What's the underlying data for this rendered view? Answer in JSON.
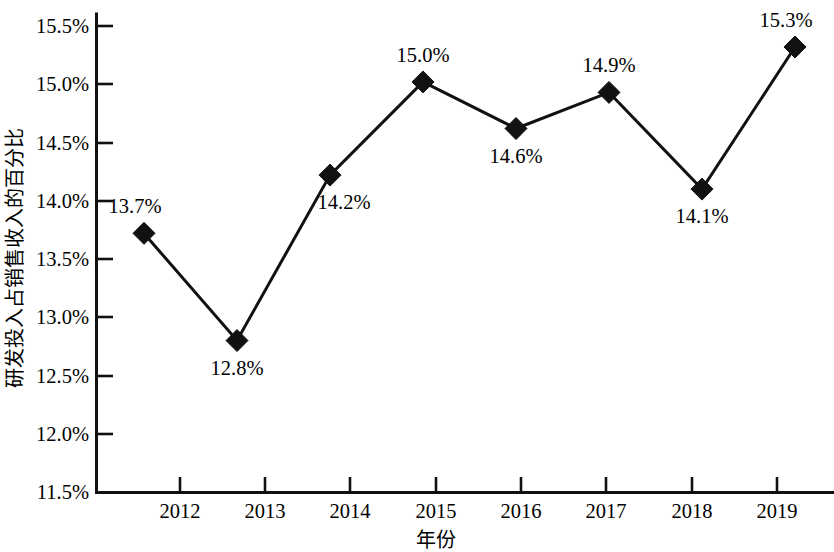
{
  "chart_data": {
    "type": "line",
    "title": "",
    "subtitle": "",
    "xlabel": "年份",
    "ylabel": "研发投入占销售收入的百分比",
    "categories": [
      "2012",
      "2013",
      "2014",
      "2015",
      "2016",
      "2017",
      "2018",
      "2019"
    ],
    "x": [
      2012,
      2013,
      2014,
      2015,
      2016,
      2017,
      2018,
      2019
    ],
    "values": [
      13.7,
      12.8,
      14.2,
      15.0,
      14.6,
      14.9,
      14.1,
      15.3
    ],
    "plotted_values": [
      13.72,
      12.8,
      14.22,
      15.02,
      14.62,
      14.93,
      14.1,
      15.32
    ],
    "point_labels": [
      "13.7%",
      "12.8%",
      "14.2%",
      "15.0%",
      "14.6%",
      "14.9%",
      "14.1%",
      "15.3%"
    ],
    "label_positions": [
      "above-left",
      "below",
      "below-right",
      "above",
      "below",
      "above",
      "below",
      "above-left"
    ],
    "series": [
      {
        "name": "研发投入占销售收入的百分比",
        "values": [
          13.7,
          12.8,
          14.2,
          15.0,
          14.6,
          14.9,
          14.1,
          15.3
        ],
        "color": "#111111",
        "marker": "diamond"
      }
    ],
    "ylim": [
      11.5,
      15.5
    ],
    "ytick_values": [
      11.5,
      12.0,
      12.5,
      13.0,
      13.5,
      14.0,
      14.5,
      15.0,
      15.5
    ],
    "ytick_labels": [
      "11.5%",
      "12.0%",
      "12.5%",
      "13.0%",
      "13.5%",
      "14.0%",
      "14.5%",
      "15.0%",
      "15.5%"
    ],
    "xtick_labels": [
      "2012",
      "2013",
      "2014",
      "2015",
      "2016",
      "2017",
      "2018",
      "2019"
    ],
    "grid": false,
    "legend": false,
    "legend_position": "none",
    "line_color": "#111111",
    "axis_color": "#111111"
  }
}
